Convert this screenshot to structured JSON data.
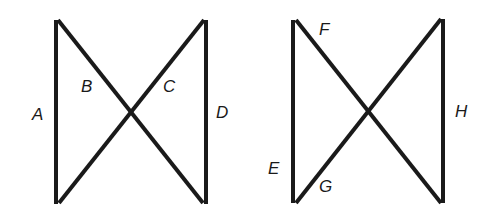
{
  "figures": [
    {
      "name": "left-figure",
      "labels": {
        "A": "A",
        "B": "B",
        "C": "C",
        "D": "D"
      }
    },
    {
      "name": "right-figure",
      "labels": {
        "E": "E",
        "F": "F",
        "G": "G",
        "H": "H"
      }
    }
  ],
  "colors": {
    "line": "#1a1a1a",
    "background": "#ffffff"
  }
}
